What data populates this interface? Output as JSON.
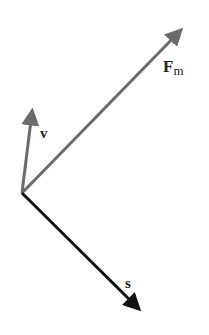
{
  "diagram": {
    "origin": {
      "x": 22,
      "y": 193
    },
    "vectors": [
      {
        "id": "Fm",
        "label": "F",
        "subscript": "m",
        "tip": {
          "x": 183,
          "y": 27
        },
        "color": "#6b6b6b"
      },
      {
        "id": "v",
        "label": "v",
        "tip": {
          "x": 33,
          "y": 107
        },
        "color": "#6b6b6b"
      },
      {
        "id": "s",
        "label": "s",
        "tip": {
          "x": 142,
          "y": 312
        },
        "color": "#111111"
      }
    ]
  }
}
